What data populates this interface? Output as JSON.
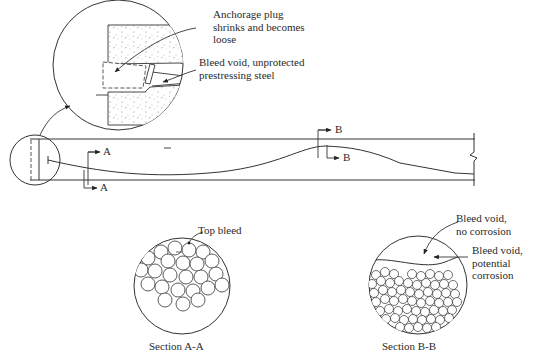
{
  "figure": {
    "type": "Grouted post-tensioning tendon defects diagram",
    "detail_callout": {
      "labels": [
        {
          "id": "anchorage_plug",
          "lines": [
            "Anchorage plug",
            "shrinks and becomes",
            "loose"
          ]
        },
        {
          "id": "bleed_void_steel",
          "lines": [
            "Bleed void, unprotected",
            "prestressing steel"
          ]
        }
      ]
    },
    "beam": {
      "section_marks": {
        "a_top": "A",
        "a_bottom": "A",
        "b_top": "B",
        "b_bottom": "B"
      }
    },
    "section_a": {
      "label": "Top bleed",
      "caption": "Section A-A"
    },
    "section_b": {
      "label_1": [
        "Bleed void,",
        "no corrosion"
      ],
      "label_2": [
        "Bleed void,",
        "potential",
        "corrosion"
      ],
      "caption": "Section B-B"
    }
  }
}
